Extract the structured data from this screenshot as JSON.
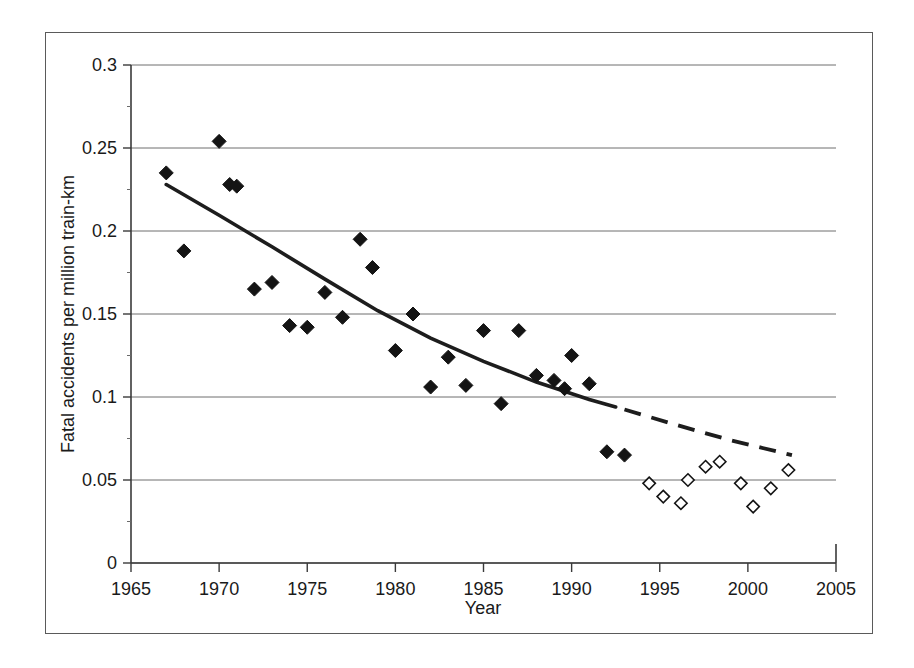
{
  "figure": {
    "frame_color": "#5a5a5a",
    "background": "#ffffff"
  },
  "chart_data": {
    "type": "scatter",
    "title": "",
    "xlabel": "Year",
    "ylabel": "Fatal accidents per million train-km",
    "xlim": [
      1965,
      2005
    ],
    "ylim": [
      0,
      0.3
    ],
    "xticks": [
      1965,
      1970,
      1975,
      1980,
      1985,
      1990,
      1995,
      2000,
      2005
    ],
    "xtick_labels": [
      "1965",
      "1970",
      "1975",
      "1980",
      "1985",
      "1990",
      "1995",
      "2000",
      "2005"
    ],
    "yticks": [
      0,
      0.05,
      0.1,
      0.15,
      0.2,
      0.25,
      0.3
    ],
    "ytick_labels": [
      "0",
      "0.05",
      "0.1",
      "0.15",
      "0.2",
      "0.25",
      "0.3"
    ],
    "grid": "horizontal",
    "legend": "none",
    "series": [
      {
        "name": "Fatal accidents (filled diamonds)",
        "marker": "filled-diamond",
        "color": "#141414",
        "x": [
          1967,
          1968,
          1970,
          1970.6,
          1971,
          1972,
          1973,
          1974,
          1975,
          1976,
          1977,
          1978,
          1978.7,
          1980,
          1981,
          1982,
          1983,
          1984,
          1985,
          1986,
          1987,
          1988,
          1989,
          1989.6,
          1990,
          1991,
          1992,
          1993
        ],
        "y": [
          0.235,
          0.188,
          0.254,
          0.228,
          0.227,
          0.165,
          0.169,
          0.143,
          0.142,
          0.163,
          0.148,
          0.195,
          0.178,
          0.128,
          0.15,
          0.106,
          0.124,
          0.107,
          0.14,
          0.096,
          0.14,
          0.113,
          0.11,
          0.105,
          0.125,
          0.108,
          0.067,
          0.065
        ]
      },
      {
        "name": "Fatal accidents (open diamonds)",
        "marker": "open-diamond",
        "color": "#ffffff",
        "x": [
          1994.4,
          1995.2,
          1996.2,
          1996.6,
          1997.6,
          1998.4,
          1999.6,
          2000.3,
          2001.3,
          2002.3
        ],
        "y": [
          0.048,
          0.04,
          0.036,
          0.05,
          0.058,
          0.061,
          0.048,
          0.034,
          0.045,
          0.056
        ]
      }
    ],
    "trend_lines": [
      {
        "name": "fitted-trend-solid",
        "style": "solid",
        "color": "#1d1d1d",
        "x": [
          1967.0,
          1970.0,
          1973.0,
          1976.0,
          1979.0,
          1982.0,
          1985.0,
          1988.0,
          1991.0,
          1992.5
        ],
        "y": [
          0.228,
          0.2095,
          0.1905,
          0.171,
          0.152,
          0.1355,
          0.1215,
          0.109,
          0.0985,
          0.094
        ]
      },
      {
        "name": "extrapolated-trend-dashed",
        "style": "dashed",
        "color": "#1d1d1d",
        "x": [
          1993.0,
          1996.0,
          1999.0,
          2002.5
        ],
        "y": [
          0.0925,
          0.083,
          0.074,
          0.065
        ]
      }
    ]
  }
}
